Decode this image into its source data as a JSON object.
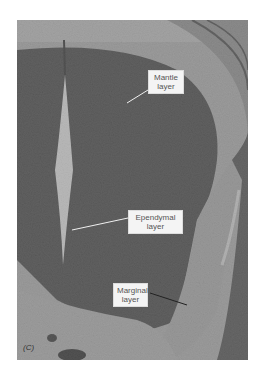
{
  "figure": {
    "panel_label": "(C)",
    "labels": [
      {
        "id": "mantle",
        "line1": "Mantle",
        "line2": "layer"
      },
      {
        "id": "ependymal",
        "line1": "Ependymal",
        "line2": "layer"
      },
      {
        "id": "marginal",
        "line1": "Marginal",
        "line2": "layer"
      }
    ],
    "colors": {
      "dark_tissue": "#3a3a3a",
      "mid_tissue": "#6e6e6e",
      "light_tissue": "#c8c8c8",
      "canal": "#ffffff",
      "label_bg": "#f4f4f4"
    }
  }
}
